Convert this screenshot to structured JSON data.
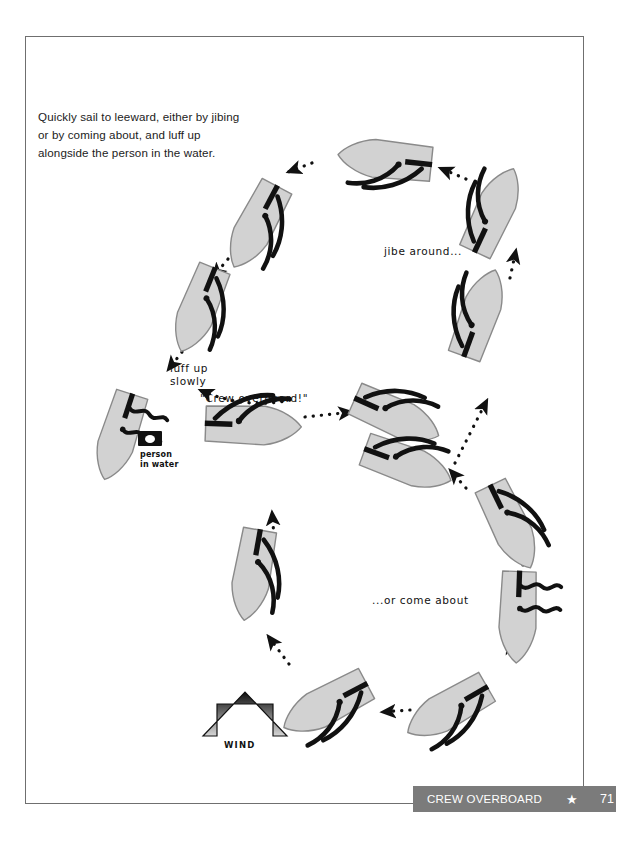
{
  "page": {
    "intro_text": "Quickly sail to leeward, either by jibing or by coming about, and luff up alongside the person in the water.",
    "bg_color": "#ffffff",
    "border_color": "#6f6f6f"
  },
  "footer": {
    "title": "CREW OVERBOARD",
    "star_glyph": "★",
    "page_number": "71",
    "bar_color": "#7b7b7b",
    "text_color": "#ffffff"
  },
  "annotations": {
    "jibe_around": "jibe around...",
    "or_come_about": "...or come about",
    "luff_up_line1": "luff up",
    "luff_up_line2": "slowly",
    "crew_overboard": "\"Crew overboard!\"",
    "wind": "WIND",
    "person_in_water_line1": "person",
    "person_in_water_line2": "in water"
  },
  "diagram": {
    "type": "sailing-maneuver-diagram",
    "hull_fill": "#d2d2d2",
    "hull_stroke": "#8a8a8a",
    "rig_color": "#111111",
    "arrow_color": "#111111",
    "wind_direction_degrees": 0,
    "wind_arrow": {
      "x": 245,
      "y": 668,
      "width": 56,
      "height": 68,
      "gradient_top": "#111111",
      "gradient_bottom": "#c9c9c9"
    },
    "boats": [
      {
        "id": "b01",
        "x": 248,
        "y": 425,
        "rot": 92,
        "sails": "normal",
        "note": "crew overboard moment"
      },
      {
        "id": "b02",
        "x": 392,
        "y": 415,
        "rot": 118,
        "sails": "normal"
      },
      {
        "id": "b03",
        "x": 403,
        "y": 463,
        "rot": 118,
        "sails": "normal"
      },
      {
        "id": "b04",
        "x": 478,
        "y": 318,
        "rot": 160,
        "sails": "normal"
      },
      {
        "id": "b05",
        "x": 492,
        "y": 215,
        "rot": 196,
        "sails": "normal"
      },
      {
        "id": "b06",
        "x": 390,
        "y": 160,
        "rot": 258,
        "sails": "normal"
      },
      {
        "id": "b07",
        "x": 258,
        "y": 222,
        "rot": 312,
        "sails": "normal"
      },
      {
        "id": "b08",
        "x": 200,
        "y": 305,
        "rot": 330,
        "sails": "normal"
      },
      {
        "id": "b09",
        "x": 120,
        "y": 430,
        "rot": 334,
        "sails": "luffing",
        "note": "luff up alongside"
      },
      {
        "id": "b10",
        "x": 508,
        "y": 522,
        "rot": 157,
        "sails": "normal"
      },
      {
        "id": "b11",
        "x": 518,
        "y": 612,
        "rot": 180,
        "sails": "luffing",
        "note": "head to wind, coming about"
      },
      {
        "id": "b12",
        "x": 452,
        "y": 707,
        "rot": 226,
        "sails": "normal"
      },
      {
        "id": "b13",
        "x": 330,
        "y": 703,
        "rot": 246,
        "sails": "normal"
      },
      {
        "id": "b14",
        "x": 253,
        "y": 570,
        "rot": 300,
        "sails": "normal"
      }
    ],
    "track_arrows": [
      {
        "from": "b01",
        "to": "b02",
        "style": "dotted"
      },
      {
        "from": "b03",
        "to": "b04",
        "style": "dotted"
      },
      {
        "from": "b04",
        "to": "b05",
        "style": "dotted"
      },
      {
        "from": "b05",
        "to": "b06",
        "style": "dotted"
      },
      {
        "from": "b06",
        "to": "b07",
        "style": "dotted"
      },
      {
        "from": "b07",
        "to": "b08",
        "style": "dotted"
      },
      {
        "from": "b08",
        "to": "b09",
        "style": "dotted"
      },
      {
        "from": "b01",
        "to": "b14",
        "style": "dotted-curve"
      },
      {
        "from": "b14",
        "to": "b13",
        "style": "dotted"
      },
      {
        "from": "b13",
        "to": "b12",
        "style": "dotted"
      },
      {
        "from": "b12",
        "to": "b11",
        "style": "dotted"
      },
      {
        "from": "b11",
        "to": "b10",
        "style": "dotted"
      },
      {
        "from": "b10",
        "to": "b03",
        "style": "dotted"
      }
    ]
  }
}
